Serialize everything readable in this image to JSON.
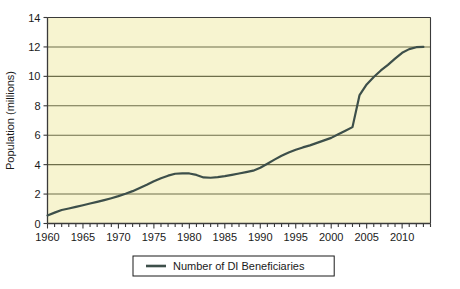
{
  "chart_data": {
    "type": "line",
    "title": "",
    "subtitle": "",
    "xlabel": "",
    "ylabel": "Population (millions)",
    "xlim": [
      1960,
      2014
    ],
    "ylim": [
      0,
      14
    ],
    "grid": true,
    "grid_axis": "y",
    "legend_position": "bottom",
    "plot_background": "#F7F4D0",
    "line_color": "#3D4F4A",
    "axis_color": "#3A3A3A",
    "gridline_color": "#6E6E4A",
    "x_tick_labels": [
      "1960",
      "1965",
      "1970",
      "1975",
      "1980",
      "1985",
      "1990",
      "1995",
      "2000",
      "2005",
      "2010"
    ],
    "x_tick_values": [
      1960,
      1965,
      1970,
      1975,
      1980,
      1985,
      1990,
      1995,
      2000,
      2005,
      2010
    ],
    "x_minor_tick_step": 1,
    "y_tick_labels": [
      "0",
      "2",
      "4",
      "6",
      "8",
      "10",
      "12",
      "14"
    ],
    "y_tick_values": [
      0,
      2,
      4,
      6,
      8,
      10,
      12,
      14
    ],
    "series": [
      {
        "name": "Number of DI Beneficiaries",
        "x": [
          1960,
          1961,
          1962,
          1963,
          1964,
          1965,
          1966,
          1967,
          1968,
          1969,
          1970,
          1971,
          1972,
          1973,
          1974,
          1975,
          1976,
          1977,
          1978,
          1979,
          1980,
          1981,
          1982,
          1983,
          1984,
          1985,
          1986,
          1987,
          1988,
          1989,
          1990,
          1991,
          1992,
          1993,
          1994,
          1995,
          1996,
          1997,
          1998,
          1999,
          2000,
          2001,
          2002,
          2003,
          2004,
          2005,
          2006,
          2007,
          2008,
          2009,
          2010,
          2011,
          2012,
          2013
        ],
        "values": [
          0.55,
          0.74,
          0.92,
          1.02,
          1.13,
          1.24,
          1.36,
          1.47,
          1.59,
          1.72,
          1.86,
          2.02,
          2.2,
          2.42,
          2.63,
          2.87,
          3.08,
          3.25,
          3.38,
          3.41,
          3.4,
          3.3,
          3.13,
          3.11,
          3.15,
          3.22,
          3.31,
          3.4,
          3.49,
          3.59,
          3.79,
          4.06,
          4.34,
          4.6,
          4.82,
          5.01,
          5.17,
          5.31,
          5.48,
          5.65,
          5.82,
          6.07,
          6.31,
          6.55,
          8.73,
          9.45,
          9.96,
          10.4,
          10.78,
          11.2,
          11.6,
          11.85,
          11.98,
          12.0
        ]
      }
    ],
    "legend": [
      {
        "label": "Number of DI Beneficiaries",
        "color": "#3D4F4A"
      }
    ]
  }
}
